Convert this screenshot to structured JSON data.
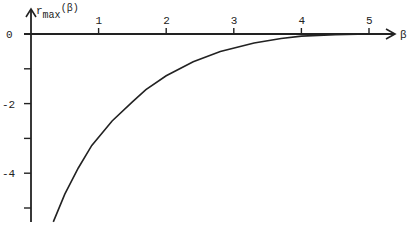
{
  "chart_data": {
    "type": "line",
    "title": "",
    "xlabel": "β",
    "ylabel": "r_max(β)",
    "ylabel_main": "r",
    "ylabel_sub": "max",
    "ylabel_arg": "(β)",
    "x_ticks": [
      1,
      2,
      3,
      4,
      5
    ],
    "x_tick_labels": [
      "1",
      "2",
      "3",
      "4",
      "5"
    ],
    "y_ticks": [
      0,
      -1,
      -2,
      -3,
      -4,
      -5
    ],
    "y_tick_labels": {
      "0": "0",
      "-2": "-2",
      "-4": "-4"
    },
    "xlim": [
      0,
      5.4
    ],
    "ylim": [
      -5.5,
      0.5
    ],
    "grid": false,
    "legend": null,
    "series": [
      {
        "name": "r_max(β)",
        "x": [
          0.33,
          0.5,
          0.7,
          0.9,
          1.2,
          1.5,
          1.7,
          2.0,
          2.4,
          2.8,
          3.3,
          3.7,
          4.0,
          4.5,
          5.0
        ],
        "y": [
          -5.4,
          -4.6,
          -3.85,
          -3.2,
          -2.5,
          -1.95,
          -1.6,
          -1.2,
          -0.8,
          -0.5,
          -0.26,
          -0.13,
          -0.06,
          -0.02,
          0.0
        ]
      }
    ]
  }
}
